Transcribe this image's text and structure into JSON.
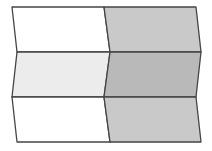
{
  "diagram": {
    "stroke": "#444444",
    "tiles": [
      {
        "id": "r1c1",
        "fill": "#ffffff",
        "points": "12,7 104,7 110,52 17,52"
      },
      {
        "id": "r1c2",
        "fill": "#c9c9c9",
        "points": "104,7 196,7 201,52 110,52"
      },
      {
        "id": "r2c1",
        "fill": "#ececec",
        "points": "17,52 110,52 104,97 12,97"
      },
      {
        "id": "r2c2",
        "fill": "#b9b9b9",
        "points": "110,52 201,52 196,97 104,97"
      },
      {
        "id": "r3c1",
        "fill": "#ffffff",
        "points": "12,97 104,97 110,142 17,142"
      },
      {
        "id": "r3c2",
        "fill": "#c9c9c9",
        "points": "104,97 196,97 201,142 110,142"
      }
    ]
  }
}
